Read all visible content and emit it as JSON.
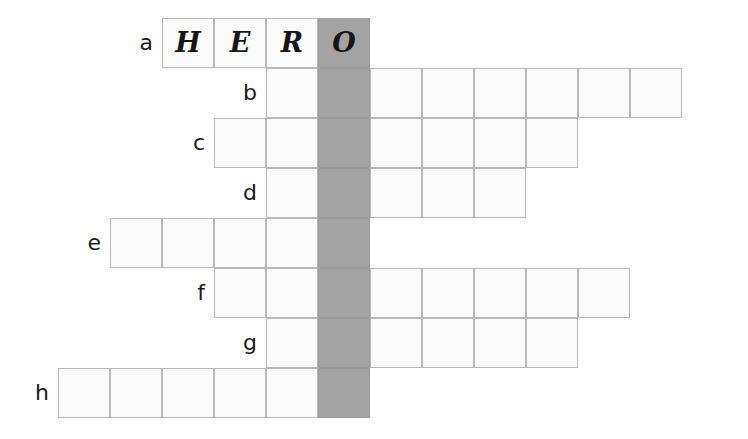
{
  "puzzle": {
    "type": "crossword-word-ladder",
    "canvas": {
      "width": 748,
      "height": 439
    },
    "geometry": {
      "cell_width": 52,
      "cell_height": 50,
      "grid_origin_x": 6,
      "grid_origin_y": 18,
      "solution_column_index": 6
    },
    "colors": {
      "solution_column": "#a3a3a3",
      "cell_fill": "#fbfbfb",
      "cell_border": "#b8b8b8",
      "label_text": "#1a1a1a",
      "letter_text": "#161616",
      "background": "#ffffff"
    },
    "solution_column": {
      "name": "solution-column",
      "index": 6,
      "start_row": 0,
      "end_row": 7,
      "letters_visible": [
        "O",
        "",
        "",
        "",
        "",
        "",
        "",
        ""
      ]
    },
    "rows": [
      {
        "label": "a",
        "start_col": 3,
        "length": 4,
        "letters": [
          "H",
          "E",
          "R",
          "O"
        ]
      },
      {
        "label": "b",
        "start_col": 5,
        "length": 8,
        "letters": [
          "",
          "",
          "",
          "",
          "",
          "",
          "",
          ""
        ]
      },
      {
        "label": "c",
        "start_col": 4,
        "length": 7,
        "letters": [
          "",
          "",
          "",
          "",
          "",
          "",
          ""
        ]
      },
      {
        "label": "d",
        "start_col": 5,
        "length": 5,
        "letters": [
          "",
          "",
          "",
          "",
          ""
        ]
      },
      {
        "label": "e",
        "start_col": 2,
        "length": 5,
        "letters": [
          "",
          "",
          "",
          "",
          ""
        ]
      },
      {
        "label": "f",
        "start_col": 4,
        "length": 8,
        "letters": [
          "",
          "",
          "",
          "",
          "",
          "",
          "",
          ""
        ]
      },
      {
        "label": "g",
        "start_col": 5,
        "length": 6,
        "letters": [
          "",
          "",
          "",
          "",
          "",
          ""
        ]
      },
      {
        "label": "h",
        "start_col": 1,
        "length": 6,
        "letters": [
          "",
          "",
          "",
          "",
          "",
          ""
        ]
      }
    ]
  }
}
